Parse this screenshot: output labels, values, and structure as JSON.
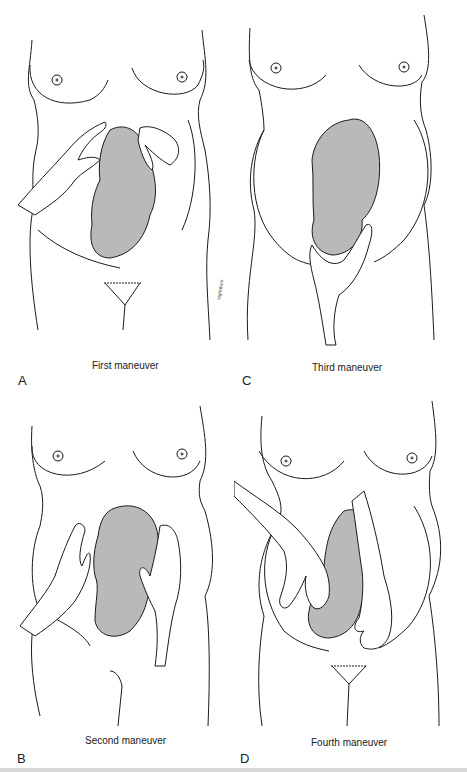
{
  "figure": {
    "panels": [
      {
        "id": "A",
        "letter": "A",
        "caption": "First maneuver"
      },
      {
        "id": "C",
        "letter": "C",
        "caption": "Third maneuver"
      },
      {
        "id": "B",
        "letter": "B",
        "caption": "Second maneuver"
      },
      {
        "id": "D",
        "letter": "D",
        "caption": "Fourth maneuver"
      }
    ],
    "colors": {
      "line": "#1a1a1a",
      "fetus_fill": "#b9b9b9",
      "background": "#ffffff"
    }
  }
}
